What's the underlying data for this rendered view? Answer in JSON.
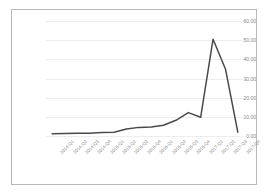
{
  "chart_data": {
    "type": "line",
    "title": "",
    "subtitle": "",
    "xlabel": "",
    "ylabel": "",
    "categories": [
      "2014-Q1",
      "2014-Q2",
      "2014-Q3",
      "2014-Q4",
      "2015-Q1",
      "2015-Q2",
      "2015-Q3",
      "2015-Q4",
      "2016-Q1",
      "2016-Q2",
      "2016-Q3",
      "2016-Q4",
      "2017-Q1",
      "2017-Q2",
      "2017-Q3",
      "2017-Q4"
    ],
    "series": [
      {
        "name": "",
        "values": [
          1.2,
          1.3,
          1.4,
          1.5,
          1.8,
          2.0,
          3.6,
          4.5,
          4.7,
          5.6,
          8.2,
          12.2,
          9.8,
          50.5,
          35.0,
          2.0
        ]
      }
    ],
    "ylim": [
      0,
      60
    ],
    "yticks": [
      0,
      10,
      20,
      30,
      40,
      50,
      60
    ],
    "ytick_labels": [
      "0.00",
      "10.00",
      "20.00",
      "30.00",
      "40.00",
      "50.00",
      "60.00"
    ],
    "grid": true,
    "grid_axis": "y",
    "legend": false,
    "legend_position": "none",
    "colors": {
      "line": "#4a4a4a",
      "grid": "#ededed",
      "tick_text": "#8a8a8a",
      "border": "#b9b9b9",
      "background": "#ffffff"
    }
  }
}
